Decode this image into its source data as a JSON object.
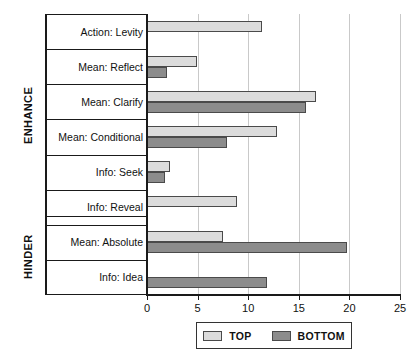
{
  "chart_data": {
    "type": "bar",
    "orientation": "horizontal",
    "title": "",
    "xlabel": "",
    "ylabel": "",
    "xlim": [
      0,
      25
    ],
    "xticks": [
      0,
      5,
      10,
      15,
      20,
      25
    ],
    "xtick_labels": [
      "0",
      "5",
      "10",
      "15",
      "20",
      "25"
    ],
    "grid": true,
    "legend_position": "bottom",
    "categories": [
      "Action: Levity",
      "Mean: Reflect",
      "Mean: Clarify",
      "Mean: Conditional",
      "Info: Seek",
      "Info: Reveal",
      "Mean: Absolute",
      "Info: Idea"
    ],
    "series": [
      {
        "name": "TOP",
        "color": "#dcdcdc",
        "values": [
          11.4,
          4.9,
          16.7,
          12.8,
          2.3,
          8.9,
          7.5,
          0
        ]
      },
      {
        "name": "BOTTOM",
        "color": "#8c8c8c",
        "values": [
          0,
          2.0,
          15.7,
          7.9,
          1.8,
          0,
          19.8,
          11.9
        ]
      }
    ],
    "groups": [
      {
        "label": "ENHANCE",
        "categories": [
          "Action: Levity",
          "Mean: Reflect",
          "Mean: Clarify",
          "Mean: Conditional",
          "Info: Seek",
          "Info: Reveal"
        ]
      },
      {
        "label": "HINDER",
        "categories": [
          "Mean: Absolute",
          "Info: Idea"
        ]
      }
    ]
  },
  "legend": {
    "items": [
      {
        "label": "TOP",
        "swatch": "top"
      },
      {
        "label": "BOTTOM",
        "swatch": "bottom"
      }
    ]
  }
}
